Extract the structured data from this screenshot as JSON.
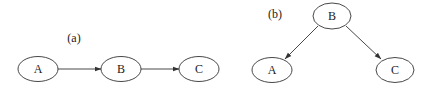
{
  "colors": {
    "stroke": "#333333",
    "text": "#222222",
    "background": "#ffffff"
  },
  "panels": [
    {
      "id": "a",
      "label": "(a)",
      "label_pos": {
        "x": 74,
        "y": 42
      },
      "nodes": [
        {
          "id": "A",
          "label": "A",
          "cx": 38,
          "cy": 69,
          "rx": 20,
          "ry": 12.5
        },
        {
          "id": "B",
          "label": "B",
          "cx": 121,
          "cy": 69,
          "rx": 20,
          "ry": 12.5
        },
        {
          "id": "C",
          "label": "C",
          "cx": 199,
          "cy": 69,
          "rx": 20,
          "ry": 12.5
        }
      ],
      "edges": [
        {
          "from": "A",
          "to": "B"
        },
        {
          "from": "B",
          "to": "C"
        }
      ]
    },
    {
      "id": "b",
      "label": "(b)",
      "label_pos": {
        "x": 275,
        "y": 18
      },
      "nodes": [
        {
          "id": "B",
          "label": "B",
          "cx": 332,
          "cy": 16,
          "rx": 19,
          "ry": 13
        },
        {
          "id": "A",
          "label": "A",
          "cx": 272,
          "cy": 70,
          "rx": 20,
          "ry": 12.5
        },
        {
          "id": "C",
          "label": "C",
          "cx": 395,
          "cy": 70,
          "rx": 19,
          "ry": 12.5
        }
      ],
      "edges": [
        {
          "from": "B",
          "to": "A"
        },
        {
          "from": "B",
          "to": "C"
        }
      ]
    }
  ]
}
